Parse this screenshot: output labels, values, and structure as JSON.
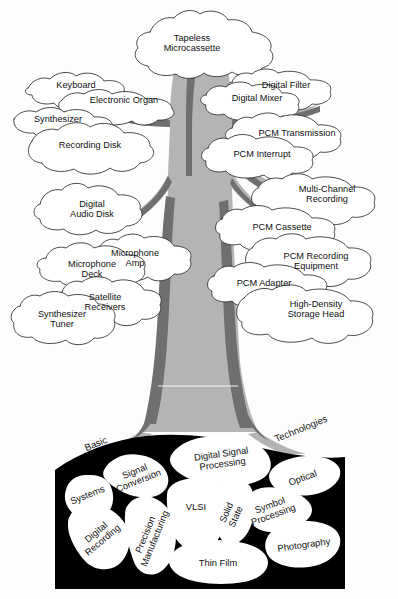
{
  "figure": {
    "background_color": "#fdfdfd",
    "ink_color": "#101010",
    "trunk_light_color": "#b4b4b4",
    "trunk_dark_color": "#6f6f6f",
    "root_box_color": "#000000",
    "leaf_fill_color": "#ffffff"
  },
  "canopy": {
    "leaves": [
      {
        "id": "tapeless-microcassette",
        "lines": [
          "Tapeless",
          "Microcassette"
        ],
        "x": 192,
        "y": 44
      },
      {
        "id": "keyboard",
        "lines": [
          "Keyboard"
        ],
        "x": 76,
        "y": 86
      },
      {
        "id": "electronic-organ",
        "lines": [
          "Electronic Organ"
        ],
        "x": 124,
        "y": 101
      },
      {
        "id": "synthesizer",
        "lines": [
          "Synthesizer"
        ],
        "x": 58,
        "y": 120
      },
      {
        "id": "recording-disk",
        "lines": [
          "Recording Disk"
        ],
        "x": 90,
        "y": 146
      },
      {
        "id": "digital-audio-disk",
        "lines": [
          "Digital",
          "Audio Disk"
        ],
        "x": 92,
        "y": 210
      },
      {
        "id": "microphone-amp",
        "lines": [
          "Microphone",
          "Amp"
        ],
        "x": 135,
        "y": 259
      },
      {
        "id": "microphone-deck",
        "lines": [
          "Microphone",
          "Deck"
        ],
        "x": 92,
        "y": 270
      },
      {
        "id": "satellite-receivers",
        "lines": [
          "Satellite",
          "Receivers"
        ],
        "x": 105,
        "y": 303
      },
      {
        "id": "synthesizer-tuner",
        "lines": [
          "Synthesizer",
          "Tuner"
        ],
        "x": 62,
        "y": 320
      },
      {
        "id": "digital-filter",
        "lines": [
          "Digital Filter"
        ],
        "x": 286,
        "y": 86
      },
      {
        "id": "digital-mixer",
        "lines": [
          "Digital Mixer"
        ],
        "x": 257,
        "y": 99
      },
      {
        "id": "pcm-transmission",
        "lines": [
          "PCM Transmission"
        ],
        "x": 297,
        "y": 134
      },
      {
        "id": "pcm-interrupt",
        "lines": [
          "PCM Interrupt"
        ],
        "x": 262,
        "y": 155
      },
      {
        "id": "multi-channel-recording",
        "lines": [
          "Multi-Channel",
          "Recording"
        ],
        "x": 327,
        "y": 195
      },
      {
        "id": "pcm-cassette",
        "lines": [
          "PCM Cassette"
        ],
        "x": 282,
        "y": 228
      },
      {
        "id": "pcm-recording-equipment",
        "lines": [
          "PCM Recording",
          "Equipment"
        ],
        "x": 316,
        "y": 262
      },
      {
        "id": "pcm-adapter",
        "lines": [
          "PCM Adapter"
        ],
        "x": 264,
        "y": 284
      },
      {
        "id": "high-density-storage-head",
        "lines": [
          "High-Density",
          "Storage Head"
        ],
        "x": 316,
        "y": 310
      }
    ]
  },
  "roots": {
    "region_labels": [
      {
        "id": "basic",
        "text": "Basic",
        "x": 96,
        "y": 444,
        "rotation": -22
      },
      {
        "id": "technologies",
        "text": "Technologies",
        "x": 301,
        "y": 429,
        "rotation": -22
      }
    ],
    "stones": [
      {
        "id": "systems",
        "lines": [
          "Systems"
        ],
        "x": 88,
        "y": 496,
        "rotation": -22
      },
      {
        "id": "signal-conversion",
        "lines": [
          "Signal",
          "Conversion"
        ],
        "x": 137,
        "y": 477,
        "rotation": -22
      },
      {
        "id": "digital-recording",
        "lines": [
          "Digital",
          "Recording"
        ],
        "x": 100,
        "y": 537,
        "rotation": -40
      },
      {
        "id": "precision-manufacturing",
        "lines": [
          "Precision",
          "Manufacturing"
        ],
        "x": 151,
        "y": 537,
        "rotation": -68
      },
      {
        "id": "digital-signal-processing",
        "lines": [
          "Digital Signal",
          "Processing"
        ],
        "x": 222,
        "y": 460,
        "rotation": -8
      },
      {
        "id": "vlsi",
        "lines": [
          "VLSI"
        ],
        "x": 196,
        "y": 508,
        "rotation": 0
      },
      {
        "id": "solid-state",
        "lines": [
          "Solid",
          "State"
        ],
        "x": 232,
        "y": 515,
        "rotation": -66
      },
      {
        "id": "symbol-processing",
        "lines": [
          "Symbol",
          "Processing"
        ],
        "x": 272,
        "y": 511,
        "rotation": -20
      },
      {
        "id": "optical",
        "lines": [
          "Optical"
        ],
        "x": 303,
        "y": 479,
        "rotation": -20
      },
      {
        "id": "photography",
        "lines": [
          "Photography"
        ],
        "x": 304,
        "y": 546,
        "rotation": -8
      },
      {
        "id": "thin-film",
        "lines": [
          "Thin Film"
        ],
        "x": 218,
        "y": 564,
        "rotation": 0
      }
    ]
  }
}
